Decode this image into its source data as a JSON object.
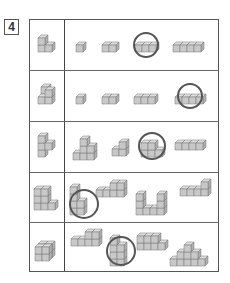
{
  "question": {
    "number": "4"
  },
  "colors": {
    "cube_fill": "#c8c8c8",
    "cube_top": "#dedede",
    "cube_side": "#b0b0b0",
    "cube_stroke": "#777777",
    "circle": "#555555",
    "border": "#555555"
  },
  "rows": [
    {
      "reference": "L-shape 3 cubes",
      "options": [
        "1 cube",
        "2 cubes",
        "3 cubes",
        "4 cubes"
      ],
      "circled_index": 2
    },
    {
      "reference": "4-cube step shape",
      "options": [
        "1 cube",
        "2 cubes",
        "3 cubes",
        "4 cubes"
      ],
      "circled_index": 3
    },
    {
      "reference": "2x2 block with offset cube",
      "options": [
        "staircase 6 cubes",
        "step 3 cubes",
        "L 2x2 with top",
        "4 cubes row"
      ],
      "circled_index": 2
    },
    {
      "reference": "L-shape 2 tall with base",
      "options": [
        "L tall stack",
        "row with tall end",
        "U-shape",
        "row with raised end"
      ],
      "circled_index": 0
    },
    {
      "reference": "2x2x2 cube block",
      "options": [
        "step wall",
        "tall stack",
        "block with side",
        "pyramid"
      ],
      "circled_index": 1
    }
  ]
}
